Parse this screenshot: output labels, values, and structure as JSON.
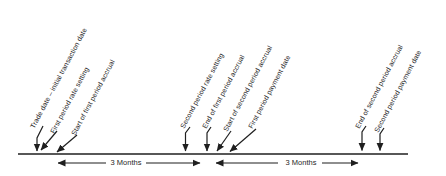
{
  "diagram": {
    "kind": "swap-payment-timeline",
    "events": [
      {
        "label": "Trade date – initial transaction date"
      },
      {
        "label": "First period rate setting"
      },
      {
        "label": "Start of first period accrual"
      },
      {
        "label": "Second period rate setting"
      },
      {
        "label": "End of first period accrual"
      },
      {
        "label": "Start of second period accrual"
      },
      {
        "label": "First period payment date"
      },
      {
        "label": "End of second period accrual"
      },
      {
        "label": "Second period payment date"
      }
    ],
    "intervals": [
      {
        "label": "3 Months"
      },
      {
        "label": "3 Months"
      }
    ],
    "colors": {
      "ink": "#1f1f1f",
      "background": "#ffffff"
    }
  }
}
